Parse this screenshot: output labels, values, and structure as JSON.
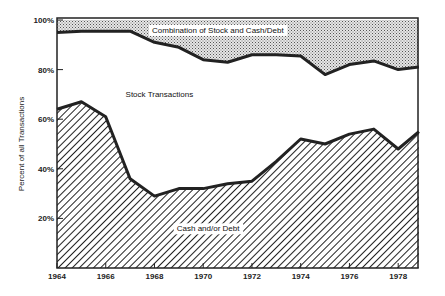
{
  "chart_data": {
    "type": "area",
    "stacked": true,
    "title": "",
    "xlabel": "",
    "ylabel": "Percent of all Transactions",
    "ylim": [
      0,
      100
    ],
    "xlim": [
      1964,
      1978.9
    ],
    "x_ticks": [
      1964,
      1966,
      1968,
      1970,
      1972,
      1974,
      1976,
      1978
    ],
    "y_ticks": [
      {
        "value": 20,
        "label": "20%"
      },
      {
        "value": 40,
        "label": "40%"
      },
      {
        "value": 60,
        "label": "60%"
      },
      {
        "value": 80,
        "label": "80%"
      },
      {
        "value": 100,
        "label": "100%"
      }
    ],
    "grid": false,
    "legend": "none (inline labels)",
    "x": [
      1964,
      1965,
      1966,
      1967,
      1968,
      1969,
      1970,
      1971,
      1972,
      1973,
      1974,
      1975,
      1976,
      1977,
      1978,
      1978.85
    ],
    "series": [
      {
        "name": "Cash and/or Debt",
        "pattern": "diagonal-hatch",
        "cumulative_top": [
          64,
          67,
          61,
          36,
          29,
          32,
          32,
          34,
          35,
          43,
          52,
          50,
          54,
          56,
          48,
          55
        ]
      },
      {
        "name": "Stock Transactions",
        "pattern": "white",
        "cumulative_top": [
          95,
          95.5,
          95.5,
          95.5,
          91,
          89,
          84,
          83,
          86,
          86,
          85.5,
          78,
          82,
          83.5,
          80,
          81
        ]
      },
      {
        "name": "Combination of Stock and Cash/Debt",
        "pattern": "stipple",
        "cumulative_top": [
          100,
          100,
          100,
          100,
          100,
          100,
          100,
          100,
          100,
          100,
          100,
          100,
          100,
          100,
          100,
          100
        ]
      }
    ],
    "annotations": [
      {
        "text": "Combination of Stock and Cash/Debt",
        "x": 1970.6,
        "y": 96
      },
      {
        "text": "Stock Transactions",
        "x": 1968.2,
        "y": 70
      },
      {
        "text": "Cash and/or Debt",
        "x": 1970.2,
        "y": 16
      }
    ]
  }
}
